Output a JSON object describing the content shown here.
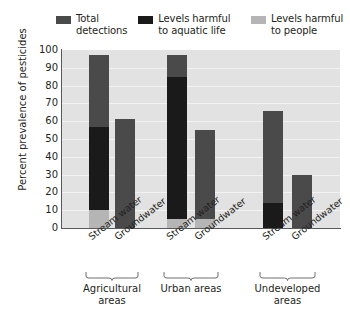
{
  "legend": {
    "items": [
      {
        "label": "Total detections",
        "color": "#4a4a4a",
        "key": "total"
      },
      {
        "label": "Levels harmful to aquatic life",
        "color": "#1a1a1a",
        "key": "aquatic"
      },
      {
        "label": "Levels harmful to people",
        "color": "#b5b5b5",
        "key": "people"
      }
    ]
  },
  "axis": {
    "y_title": "Percent prevalence of pesticides",
    "y_ticks": [
      "100",
      "90",
      "80",
      "70",
      "60",
      "50",
      "40",
      "30",
      "20",
      "10",
      "0"
    ]
  },
  "groups": [
    {
      "name": "Agricultural areas",
      "bars": [
        "Stream water",
        "Groundwater"
      ]
    },
    {
      "name": "Urban areas",
      "bars": [
        "Stream water",
        "Groundwater"
      ]
    },
    {
      "name": "Undeveloped areas",
      "bars": [
        "Stream water",
        "Groundwater"
      ]
    }
  ],
  "chart_data": {
    "type": "bar",
    "title": "",
    "xlabel": "",
    "ylabel": "Percent prevalence of pesticides",
    "ylim": [
      0,
      100
    ],
    "ytick_step": 10,
    "grid": true,
    "legend_position": "top",
    "note": "Overlaid bars: each bar's full height is Total detections; the aquatic-life and people values are drawn from the baseline up as darker/lighter overlays.",
    "categories": [
      "Agricultural areas - Stream water",
      "Agricultural areas - Groundwater",
      "Urban areas - Stream water",
      "Urban areas - Groundwater",
      "Undeveloped areas - Stream water",
      "Undeveloped areas - Groundwater"
    ],
    "series": [
      {
        "name": "Total detections",
        "color": "#4a4a4a",
        "values": [
          97,
          61,
          97,
          55,
          66,
          30
        ]
      },
      {
        "name": "Levels harmful to aquatic life",
        "color": "#1a1a1a",
        "values": [
          57,
          0,
          85,
          0,
          14,
          0
        ]
      },
      {
        "name": "Levels harmful to people",
        "color": "#b5b5b5",
        "values": [
          10,
          0,
          5,
          5,
          0,
          0
        ]
      }
    ]
  }
}
